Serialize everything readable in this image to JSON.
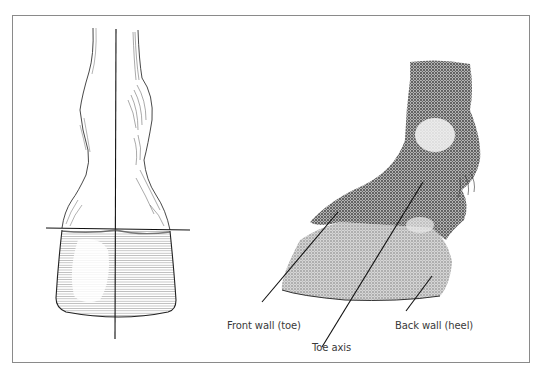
{
  "figure": {
    "type": "hoof-axis-diagram",
    "left_view": "front view of lower limb and hoof with vertical and horizontal reference lines",
    "right_view": "lateral view of pastern and hoof with parallel axis lines",
    "labels": {
      "front_wall": "Front wall (toe)",
      "toe_axis": "Toe axis",
      "back_wall": "Back wall (heel)"
    },
    "colors": {
      "frame": "#8a8a8a",
      "ink": "#1a1a1a",
      "shading": "#9a9a9a",
      "label_text": "#3a3a3a"
    }
  }
}
